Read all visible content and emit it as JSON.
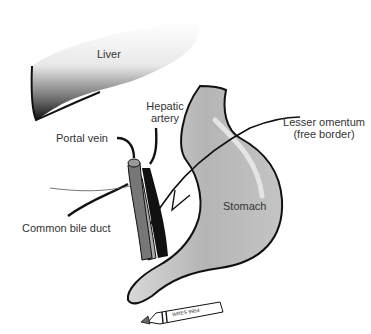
{
  "diagram": {
    "type": "anatomical-illustration",
    "labels": {
      "liver": "Liver",
      "hepatic_artery_line1": "Hepatic",
      "hepatic_artery_line2": "artery",
      "portal_vein": "Portal vein",
      "lesser_omentum_line1": "Lesser omentum",
      "lesser_omentum_line2": "(free border)",
      "common_bile_duct": "Common bile duct",
      "stomach": "Stomach",
      "pen_label": "WRES 9954"
    },
    "colors": {
      "outline": "#111111",
      "stomach_fill": "#b8b8b8",
      "stomach_highlight": "#dcdcdc",
      "liver_dark": "#1a1a1a",
      "label_text": "#333333",
      "portal_vein": "#777777",
      "hepatic_artery": "#111111",
      "bile_duct": "#aaaaaa"
    }
  }
}
